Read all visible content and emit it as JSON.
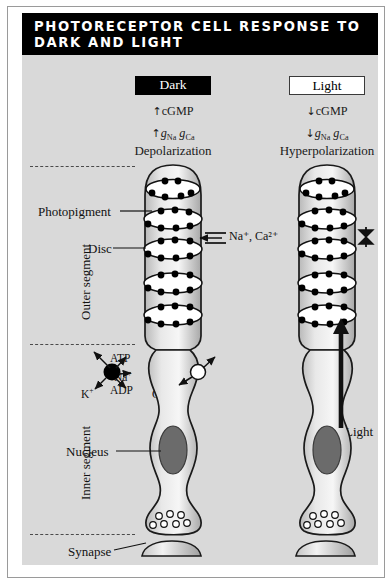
{
  "title": "PHOTORECEPTOR CELL RESPONSE TO DARK AND LIGHT",
  "colors": {
    "title_bar": "#000000",
    "title_text": "#ffffff",
    "panel_bg": "#d9d9d9",
    "page_bg": "#ffffff",
    "cell_outline": "#1a1a1a",
    "disc_fill": "#ffffff",
    "pigment_dot": "#000000",
    "nucleus_fill": "#6b6b6b",
    "pump_black": "#000000",
    "channel_white": "#ffffff",
    "dashed_line": "#4a4a4a"
  },
  "columns": [
    {
      "id": "dark",
      "label": "Dark",
      "label_style": "inverted",
      "cgmp": "cGMP",
      "cgmp_arrow": "↑",
      "conductance_arrow": "↑",
      "conductance": "g",
      "conductance_sub_1": "Na",
      "conductance_sub_2": "Ca",
      "state": "Depolarization",
      "channel_state": "open",
      "channel_ions": "Na⁺, Ca²⁺",
      "discs": 5,
      "pigments_per_row": 5
    },
    {
      "id": "light",
      "label": "Light",
      "label_style": "outlined",
      "cgmp": "cGMP",
      "cgmp_arrow": "↓",
      "conductance_arrow": "↓",
      "conductance": "g",
      "conductance_sub_1": "Na",
      "conductance_sub_2": "Ca",
      "state": "Hyperpolarization",
      "channel_state": "closed",
      "channel_ions": "",
      "discs": 5,
      "pigments_per_row": 5,
      "stimulus_label": "Light"
    }
  ],
  "side_labels": [
    {
      "id": "outer-segment",
      "text": "Outer segment"
    },
    {
      "id": "inner-segment",
      "text": "Inner segment"
    }
  ],
  "leader_labels": [
    {
      "id": "photopigment",
      "text": "Photopigment"
    },
    {
      "id": "disc",
      "text": "Disc"
    },
    {
      "id": "nucleus",
      "text": "Nucleus"
    },
    {
      "id": "synapse",
      "text": "Synapse"
    }
  ],
  "pump_labels": [
    {
      "id": "atp",
      "text": "ATP"
    },
    {
      "id": "na-pump",
      "text": "Na",
      "charge": "+"
    },
    {
      "id": "adp",
      "text": "ADP"
    },
    {
      "id": "k-pump",
      "text": "K",
      "charge": "+"
    }
  ],
  "channel_labels": [
    {
      "id": "na-channel",
      "text": "Na",
      "charge": "+"
    },
    {
      "id": "ca-channel",
      "text": "Ca",
      "charge": "2+"
    }
  ],
  "disc_channel_label": {
    "text": "Na",
    "charge": "+",
    "text2": "Ca",
    "charge2": "2+",
    "full": "Na⁺, Ca²⁺"
  },
  "vesicle_count": 7
}
